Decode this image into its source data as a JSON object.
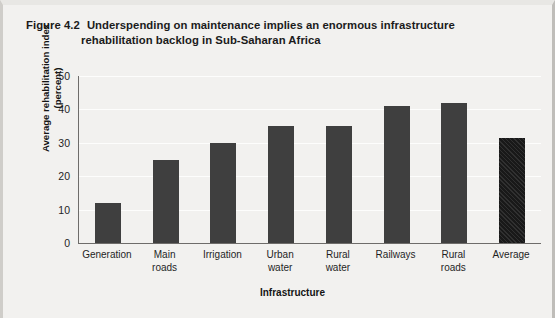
{
  "figure": {
    "number": "Figure 4.2",
    "title_line1": "Underspending on maintenance implies an enormous infrastructure",
    "title_line2": "rehabilitation backlog in Sub-Saharan Africa"
  },
  "axis": {
    "ylabel_line1": "Average rehabilitation index",
    "ylabel_line2": "(percent)",
    "xlabel": "Infrastructure",
    "yticks": [
      "50",
      "40",
      "30",
      "20",
      "10",
      "0"
    ]
  },
  "colors": {
    "bar": "#3f3f3f",
    "bar_highlight": "#191919",
    "background": "#f2f1ef",
    "axis": "#6e6c6a"
  },
  "chart_data": {
    "type": "bar",
    "xlabel": "Infrastructure",
    "ylabel": "Average rehabilitation index (percent)",
    "ylim": [
      0,
      50
    ],
    "yticks": [
      0,
      10,
      20,
      30,
      40,
      50
    ],
    "grid": true,
    "legend": "none",
    "categories": [
      "Generation",
      "Main roads",
      "Irrigation",
      "Urban water",
      "Rural water",
      "Railways",
      "Rural roads",
      "Average"
    ],
    "category_lines": [
      [
        "Generation",
        ""
      ],
      [
        "Main",
        "roads"
      ],
      [
        "Irrigation",
        ""
      ],
      [
        "Urban",
        "water"
      ],
      [
        "Rural",
        "water"
      ],
      [
        "Railways",
        ""
      ],
      [
        "Rural",
        "roads"
      ],
      [
        "Average",
        ""
      ]
    ],
    "values": [
      12,
      25,
      30,
      35,
      35,
      41,
      42,
      31.5
    ],
    "highlight_index": 7,
    "highlight_style": "hatched"
  }
}
